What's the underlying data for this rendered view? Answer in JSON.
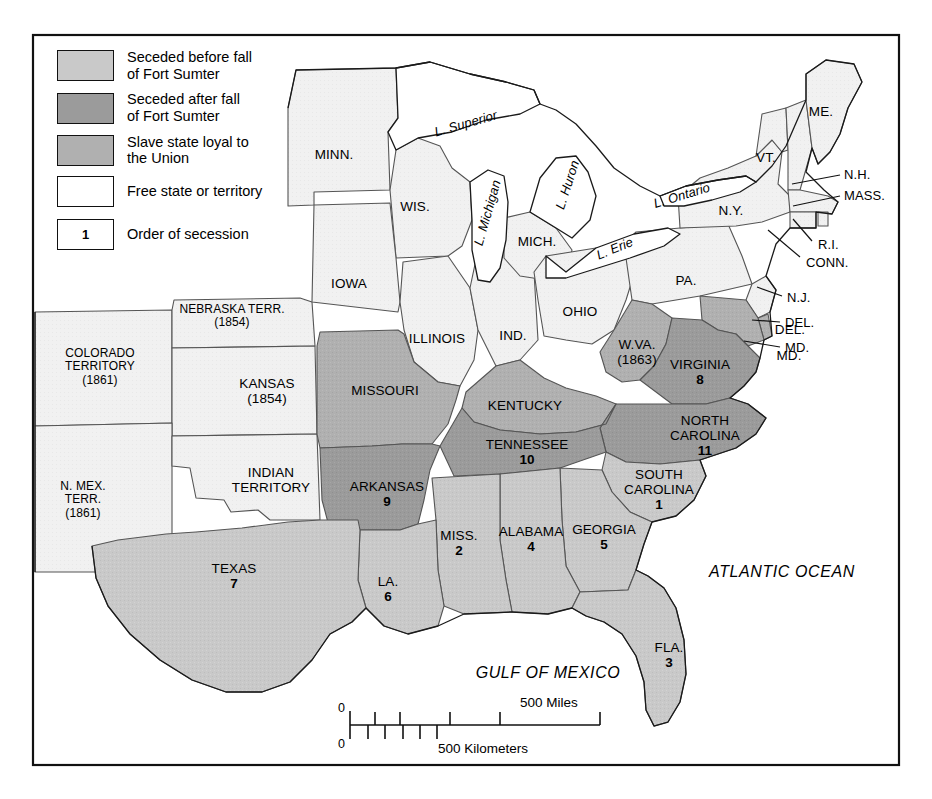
{
  "map": {
    "title": "Secession of the Southern States",
    "colors": {
      "seceded_before": "#c9c9c9",
      "seceded_after": "#9b9b9b",
      "slave_loyal": "#b0b0b0",
      "free_state": "#f1f1f1",
      "water": "#ffffff",
      "border": "#111111",
      "state_line": "#555555"
    },
    "legend": {
      "items": [
        {
          "label": "Seceded before fall\nof Fort Sumter",
          "swatch": "seceded-before-swatch",
          "color": "#c9c9c9"
        },
        {
          "label": "Seceded after fall\nof Fort Sumter",
          "swatch": "seceded-after-swatch",
          "color": "#9b9b9b"
        },
        {
          "label": "Slave state loyal to\nthe Union",
          "swatch": "slave-loyal-swatch",
          "color": "#b0b0b0"
        },
        {
          "label": "Free state or territory",
          "swatch": "free-state-swatch",
          "color": "#ffffff"
        }
      ],
      "order_key": {
        "box_value": "1",
        "label": "Order of secession"
      }
    },
    "scale": {
      "miles_zero": "0",
      "km_zero": "0",
      "miles_label": "500 Miles",
      "km_label": "500 Kilometers"
    },
    "water_labels": [
      {
        "name": "lake-superior-label",
        "text": "L. Superior",
        "x": 466,
        "y": 124,
        "rot": -16
      },
      {
        "name": "lake-michigan-label",
        "text": "L. Michigan",
        "x": 488,
        "y": 213,
        "rot": -74
      },
      {
        "name": "lake-huron-label",
        "text": "L. Huron",
        "x": 568,
        "y": 185,
        "rot": -72
      },
      {
        "name": "lake-erie-label",
        "text": "L. Erie",
        "x": 615,
        "y": 249,
        "rot": -22
      },
      {
        "name": "lake-ontario-label",
        "text": "L. Ontario",
        "x": 682,
        "y": 196,
        "rot": -17
      },
      {
        "name": "atlantic-ocean-label",
        "text": "ATLANTIC OCEAN",
        "x": 782,
        "y": 572,
        "rot": 0
      },
      {
        "name": "gulf-of-mexico-label",
        "text": "GULF OF MEXICO",
        "x": 548,
        "y": 673,
        "rot": 0
      }
    ],
    "regions": [
      {
        "name": "minnesota",
        "label": "MINN.",
        "x": 334,
        "y": 155,
        "cat": "free"
      },
      {
        "name": "wisconsin",
        "label": "WIS.",
        "x": 415,
        "y": 207,
        "cat": "free"
      },
      {
        "name": "michigan",
        "label": "MICH.",
        "x": 537,
        "y": 242,
        "cat": "free"
      },
      {
        "name": "iowa",
        "label": "IOWA",
        "x": 349,
        "y": 284,
        "cat": "free"
      },
      {
        "name": "illinois",
        "label": "ILLINOIS",
        "x": 437,
        "y": 339,
        "cat": "free"
      },
      {
        "name": "indiana",
        "label": "IND.",
        "x": 513,
        "y": 336,
        "cat": "free"
      },
      {
        "name": "ohio",
        "label": "OHIO",
        "x": 580,
        "y": 312,
        "cat": "free"
      },
      {
        "name": "pennsylvania",
        "label": "PA.",
        "x": 686,
        "y": 281,
        "cat": "free"
      },
      {
        "name": "new-york",
        "label": "N.Y.",
        "x": 731,
        "y": 211,
        "cat": "free"
      },
      {
        "name": "vermont",
        "label": "VT.",
        "x": 766,
        "y": 158,
        "cat": "free"
      },
      {
        "name": "maine",
        "label": "ME.",
        "x": 821,
        "y": 112,
        "cat": "free"
      },
      {
        "name": "nebraska-territory",
        "label": "NEBRASKA TERR.\n(1854)",
        "x": 232,
        "y": 316,
        "cat": "free"
      },
      {
        "name": "colorado-territory",
        "label": "COLORADO\nTERRITORY\n(1861)",
        "x": 100,
        "y": 367,
        "cat": "free"
      },
      {
        "name": "kansas",
        "label": "KANSAS\n(1854)",
        "x": 267,
        "y": 391,
        "cat": "free"
      },
      {
        "name": "indian-territory",
        "label": "INDIAN\nTERRITORY",
        "x": 271,
        "y": 480,
        "cat": "free"
      },
      {
        "name": "new-mexico-territory",
        "label": "N. MEX.\nTERR.\n(1861)",
        "x": 83,
        "y": 500,
        "cat": "free"
      },
      {
        "name": "missouri",
        "label": "MISSOURI",
        "x": 385,
        "y": 391,
        "cat": "loyal"
      },
      {
        "name": "kentucky",
        "label": "KENTUCKY",
        "x": 525,
        "y": 406,
        "cat": "loyal"
      },
      {
        "name": "west-virginia",
        "label": "W.VA.\n(1863)",
        "x": 637,
        "y": 352,
        "cat": "loyal"
      },
      {
        "name": "delaware",
        "label": "DEL.",
        "x": 790,
        "y": 330,
        "cat": "loyal",
        "leader": true
      },
      {
        "name": "maryland",
        "label": "MD.",
        "x": 789,
        "y": 356,
        "cat": "loyal",
        "leader": true
      },
      {
        "name": "virginia",
        "label": "VIRGINIA\n8",
        "x": 700,
        "y": 372,
        "cat": "after",
        "order": "8"
      },
      {
        "name": "north-carolina",
        "label": "NORTH\nCAROLINA\n11",
        "x": 705,
        "y": 436,
        "cat": "after",
        "order": "11"
      },
      {
        "name": "tennessee",
        "label": "TENNESSEE\n10",
        "x": 527,
        "y": 452,
        "cat": "after",
        "order": "10"
      },
      {
        "name": "arkansas",
        "label": "ARKANSAS\n9",
        "x": 387,
        "y": 494,
        "cat": "after",
        "order": "9"
      },
      {
        "name": "south-carolina",
        "label": "SOUTH\nCAROLINA\n1",
        "x": 659,
        "y": 490,
        "cat": "before",
        "order": "1"
      },
      {
        "name": "georgia",
        "label": "GEORGIA\n5",
        "x": 604,
        "y": 537,
        "cat": "before",
        "order": "5"
      },
      {
        "name": "alabama",
        "label": "ALABAMA\n4",
        "x": 531,
        "y": 539,
        "cat": "before",
        "order": "4"
      },
      {
        "name": "mississippi",
        "label": "MISS.\n2",
        "x": 459,
        "y": 543,
        "cat": "before",
        "order": "2"
      },
      {
        "name": "louisiana",
        "label": "LA.\n6",
        "x": 388,
        "y": 589,
        "cat": "before",
        "order": "6"
      },
      {
        "name": "texas",
        "label": "TEXAS\n7",
        "x": 234,
        "y": 576,
        "cat": "before",
        "order": "7"
      },
      {
        "name": "florida",
        "label": "FLA.\n3",
        "x": 669,
        "y": 655,
        "cat": "before",
        "order": "3"
      }
    ],
    "pointer_labels": [
      {
        "name": "new-hampshire-label",
        "text": "N.H.",
        "tx": 844,
        "ty": 175,
        "lx1": 840,
        "ly1": 175,
        "lx2": 792,
        "ly2": 182
      },
      {
        "name": "massachusetts-label",
        "text": "MASS.",
        "tx": 844,
        "ty": 196,
        "lx1": 840,
        "ly1": 196,
        "lx2": 793,
        "ly2": 204
      },
      {
        "name": "rhode-island-label",
        "text": "R.I.",
        "tx": 818,
        "ty": 245,
        "lx1": 814,
        "ly1": 243,
        "lx2": 793,
        "ly2": 219
      },
      {
        "name": "connecticut-label",
        "text": "CONN.",
        "tx": 806,
        "ty": 263,
        "lx1": 802,
        "ly1": 259,
        "lx2": 769,
        "ly2": 230
      },
      {
        "name": "new-jersey-label",
        "text": "N.J.",
        "tx": 787,
        "ty": 298,
        "lx1": 783,
        "ly1": 296,
        "lx2": 757,
        "ly2": 288
      },
      {
        "name": "delaware-pointer",
        "text": "DEL.",
        "tx": 785,
        "ty": 323,
        "lx1": 781,
        "ly1": 322,
        "lx2": 752,
        "ly2": 320
      },
      {
        "name": "maryland-pointer",
        "text": "MD.",
        "tx": 785,
        "ty": 348,
        "lx1": 781,
        "ly1": 347,
        "lx2": 745,
        "ly2": 340
      }
    ]
  }
}
